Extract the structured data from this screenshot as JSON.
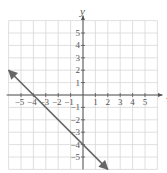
{
  "chart_data": {
    "type": "line",
    "title": "",
    "xlabel": "x",
    "ylabel": "y",
    "xlim": [
      -6,
      6
    ],
    "ylim": [
      -6,
      6
    ],
    "grid": true,
    "x_ticks": [
      -5,
      -4,
      -3,
      -2,
      -1,
      1,
      2,
      3,
      4,
      5
    ],
    "y_ticks": [
      -5,
      -4,
      -3,
      -2,
      -1,
      1,
      2,
      3,
      4,
      5
    ],
    "x_tick_labels": [
      "−5",
      "−4",
      "−3",
      "−2",
      "−1",
      "1",
      "2",
      "3",
      "4",
      "5"
    ],
    "y_tick_labels": [
      "−5",
      "−4",
      "−3",
      "−2",
      "−1",
      "1",
      "2",
      "3",
      "4",
      "5"
    ],
    "series": [
      {
        "name": "y = -x - 4",
        "equation": "y = -x - 4",
        "slope": -1,
        "y_intercept": -4,
        "x_intercept": -4,
        "points": [
          [
            -6,
            2
          ],
          [
            -4,
            0
          ],
          [
            0,
            -4
          ],
          [
            2,
            -6
          ]
        ],
        "arrows_both_ends": true,
        "color": "#666666"
      }
    ]
  },
  "colors": {
    "grid": "#d8d8d8",
    "axis": "#555555",
    "line": "#666666"
  }
}
